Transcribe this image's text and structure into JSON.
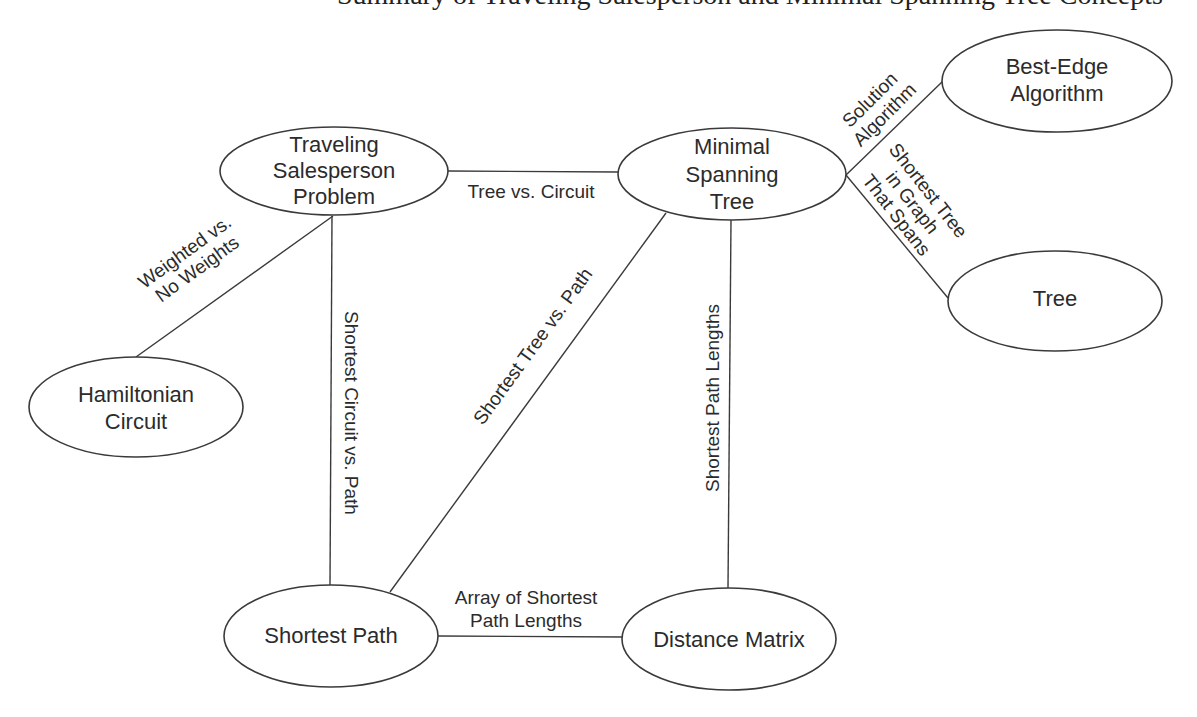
{
  "header": {
    "clipped_title": "Summary of Traveling Salesperson and Minimal Spanning Tree Concepts"
  },
  "nodes": {
    "tsp": {
      "lines": [
        "Traveling",
        "Salesperson",
        "Problem"
      ]
    },
    "mst": {
      "lines": [
        "Minimal",
        "Spanning",
        "Tree"
      ]
    },
    "best_edge": {
      "lines": [
        "Best-Edge",
        "Algorithm"
      ]
    },
    "tree": {
      "lines": [
        "Tree"
      ]
    },
    "hamiltonian": {
      "lines": [
        "Hamiltonian",
        "Circuit"
      ]
    },
    "shortest_path": {
      "lines": [
        "Shortest Path"
      ]
    },
    "distance_matrix": {
      "lines": [
        "Distance Matrix"
      ]
    }
  },
  "edges": {
    "tsp_mst": {
      "lines": [
        "Tree vs. Circuit"
      ]
    },
    "tsp_hamiltonian": {
      "lines": [
        "Weighted vs.",
        "No Weights"
      ]
    },
    "tsp_shortest_path": {
      "lines": [
        "Shortest Circuit vs. Path"
      ]
    },
    "mst_shortest_path": {
      "lines": [
        "Shortest Tree vs. Path"
      ]
    },
    "mst_distance_matrix": {
      "lines": [
        "Shortest Path Lengths"
      ]
    },
    "mst_best_edge": {
      "lines": [
        "Solution",
        "Algorithm"
      ]
    },
    "mst_tree": {
      "lines": [
        "Shortest Tree",
        "in Graph",
        "That Spans"
      ]
    },
    "shortest_path_distance_matrix": {
      "lines": [
        "Array of Shortest",
        "Path Lengths"
      ]
    }
  },
  "colors": {
    "stroke": "#3a3a3a",
    "text": "#2b2b2b",
    "background": "#ffffff"
  }
}
